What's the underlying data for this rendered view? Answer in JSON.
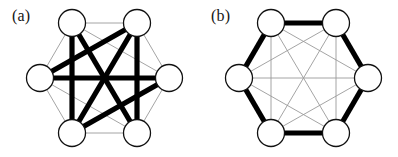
{
  "figure": {
    "background_color": "#ffffff",
    "width": 398,
    "height": 157,
    "strong_edge_color": "#000000",
    "weak_edge_color": "#9a9a9a",
    "node_fill_color": "#ffffff",
    "node_stroke_color": "#111111"
  },
  "panels": [
    {
      "id": "a",
      "label": "(a)",
      "node_count": 6,
      "node_labels": [
        "L",
        "TL",
        "TR",
        "R",
        "BR",
        "BL"
      ],
      "node_positions": [
        {
          "id": "L",
          "cx": 40,
          "cy": 78
        },
        {
          "id": "TL",
          "cx": 72,
          "cy": 23
        },
        {
          "id": "TR",
          "cx": 137,
          "cy": 23
        },
        {
          "id": "R",
          "cx": 169,
          "cy": 78
        },
        {
          "id": "BR",
          "cx": 137,
          "cy": 133
        },
        {
          "id": "BL",
          "cx": 72,
          "cy": 133
        }
      ],
      "node_radius": 13.5,
      "strong_edges": [
        [
          "TL",
          "BL"
        ],
        [
          "TR",
          "BR"
        ],
        [
          "L",
          "R"
        ],
        [
          "TL",
          "BR"
        ],
        [
          "TR",
          "BL"
        ],
        [
          "L",
          "TR"
        ],
        [
          "R",
          "BL"
        ]
      ],
      "weak_edges": [
        [
          "L",
          "TL"
        ],
        [
          "TL",
          "TR"
        ],
        [
          "TR",
          "R"
        ],
        [
          "R",
          "BR"
        ],
        [
          "BR",
          "BL"
        ],
        [
          "BL",
          "L"
        ],
        [
          "L",
          "BR"
        ],
        [
          "TL",
          "R"
        ],
        [
          "TR",
          "BL"
        ]
      ],
      "strong_edge_count": 7,
      "weak_edge_count": 8
    },
    {
      "id": "b",
      "label": "(b)",
      "node_count": 6,
      "node_labels": [
        "L",
        "TL",
        "TR",
        "R",
        "BR",
        "BL"
      ],
      "node_positions": [
        {
          "id": "L",
          "cx": 40,
          "cy": 78
        },
        {
          "id": "TL",
          "cx": 72,
          "cy": 23
        },
        {
          "id": "TR",
          "cx": 137,
          "cy": 23
        },
        {
          "id": "R",
          "cx": 169,
          "cy": 78
        },
        {
          "id": "BR",
          "cx": 137,
          "cy": 133
        },
        {
          "id": "BL",
          "cx": 72,
          "cy": 133
        }
      ],
      "node_radius": 13.5,
      "strong_edges": [
        [
          "L",
          "TL"
        ],
        [
          "TL",
          "TR"
        ],
        [
          "TR",
          "R"
        ],
        [
          "R",
          "BR"
        ],
        [
          "BR",
          "BL"
        ],
        [
          "BL",
          "L"
        ]
      ],
      "weak_edges": [
        [
          "L",
          "TR"
        ],
        [
          "L",
          "R"
        ],
        [
          "L",
          "BR"
        ],
        [
          "TL",
          "R"
        ],
        [
          "TL",
          "BR"
        ],
        [
          "TL",
          "BL"
        ],
        [
          "TR",
          "BR"
        ],
        [
          "TR",
          "BL"
        ],
        [
          "R",
          "BL"
        ]
      ],
      "strong_edge_count": 6,
      "weak_edge_count": 9
    }
  ]
}
